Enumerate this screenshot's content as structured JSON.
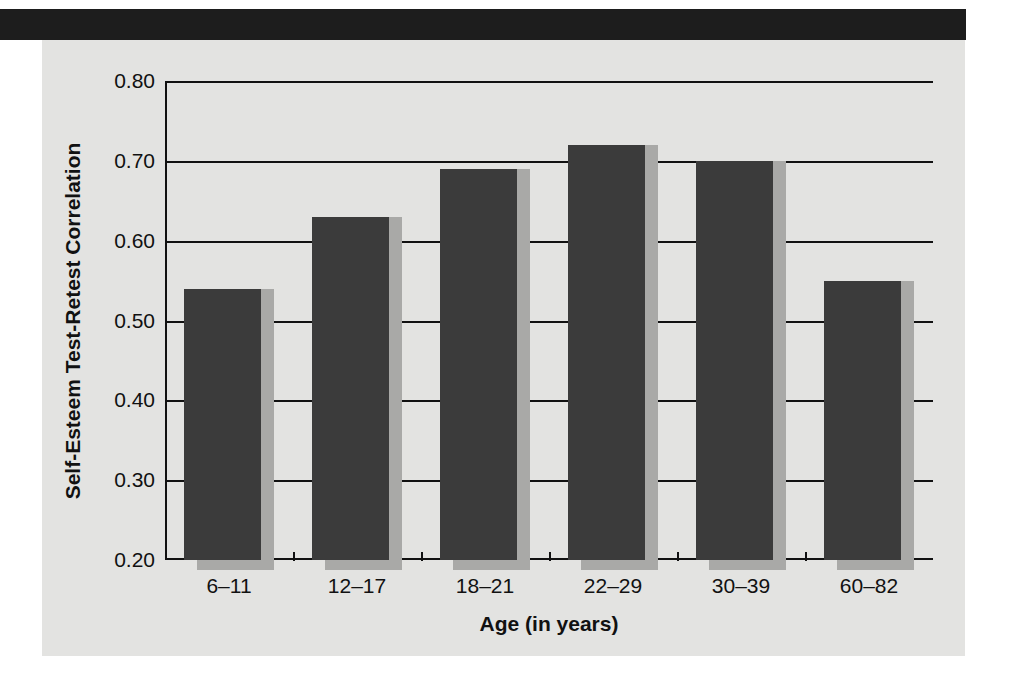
{
  "figure": {
    "background_color": "#e3e3e1",
    "band_color": "#1d1d1d",
    "bar_color": "#3b3b3b",
    "bar_shadow_color": "#a9a9a7",
    "axis_color": "#111111"
  },
  "chart_data": {
    "type": "bar",
    "title": "",
    "xlabel": "Age (in years)",
    "ylabel": "Self-Esteem Test-Retest Correlation",
    "categories": [
      "6–11",
      "12–17",
      "18–21",
      "22–29",
      "30–39",
      "60–82"
    ],
    "values": [
      0.54,
      0.63,
      0.69,
      0.72,
      0.7,
      0.55
    ],
    "ylim": [
      0.2,
      0.8
    ],
    "yticks": [
      0.8,
      0.7,
      0.6,
      0.5,
      0.4,
      0.3,
      0.2
    ],
    "ytick_labels": [
      "0.80",
      "0.70",
      "0.60",
      "0.50",
      "0.40",
      "0.30",
      "0.20"
    ],
    "grid": true,
    "legend": "none",
    "series": [
      {
        "name": "Self-Esteem Test-Retest Correlation",
        "values": [
          0.54,
          0.63,
          0.69,
          0.72,
          0.7,
          0.55
        ]
      }
    ]
  }
}
